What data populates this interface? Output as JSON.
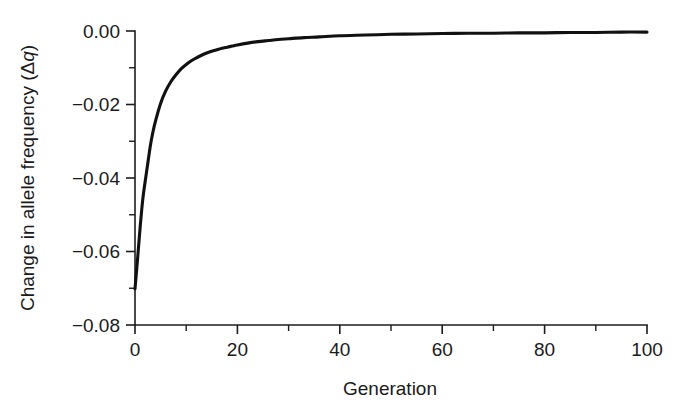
{
  "chart_data": {
    "type": "line",
    "title": "",
    "xlabel": "Generation",
    "ylabel": "Change in allele frequency (Δq)",
    "ylabel_parts": {
      "prefix": "Change in allele frequency (Δ",
      "italic": "q",
      "suffix": ")"
    },
    "xlim": [
      0,
      100
    ],
    "ylim": [
      -0.08,
      0.0
    ],
    "grid": false,
    "legend": null,
    "xticks": [
      0,
      20,
      40,
      60,
      80,
      100
    ],
    "xtick_labels": [
      "0",
      "20",
      "40",
      "60",
      "80",
      "100"
    ],
    "xticks_minor": [
      10,
      30,
      50,
      70,
      90
    ],
    "yticks": [
      0.0,
      -0.02,
      -0.04,
      -0.06,
      -0.08
    ],
    "ytick_labels": [
      "0.00",
      "−0.02",
      "−0.04",
      "−0.06",
      "−0.08"
    ],
    "yticks_minor": [
      -0.01,
      -0.03,
      -0.05,
      -0.07
    ],
    "series": [
      {
        "name": "Change in allele frequency per generation",
        "color": "#111111",
        "x": [
          0,
          0.5,
          1,
          1.5,
          2,
          2.5,
          3,
          3.5,
          4,
          5,
          6,
          7,
          8,
          9,
          10,
          11,
          12,
          13,
          14,
          15,
          16,
          17,
          18,
          19,
          20,
          22,
          24,
          26,
          28,
          30,
          33,
          36,
          40,
          45,
          50,
          55,
          60,
          65,
          70,
          75,
          80,
          85,
          90,
          95,
          100
        ],
        "y": [
          -0.0702,
          -0.062,
          -0.0535,
          -0.046,
          -0.0408,
          -0.036,
          -0.0312,
          -0.0275,
          -0.0245,
          -0.0197,
          -0.0163,
          -0.0138,
          -0.0119,
          -0.0103,
          -0.0091,
          -0.0081,
          -0.0073,
          -0.0066,
          -0.006,
          -0.0055,
          -0.0051,
          -0.0047,
          -0.0044,
          -0.0041,
          -0.0038,
          -0.0033,
          -0.0029,
          -0.0026,
          -0.0023,
          -0.0021,
          -0.0018,
          -0.0016,
          -0.0013,
          -0.0011,
          -0.0009,
          -0.0008,
          -0.0007,
          -0.0006,
          -0.0006,
          -0.0005,
          -0.0005,
          -0.0004,
          -0.0004,
          -0.0003,
          -0.0003
        ]
      }
    ]
  }
}
